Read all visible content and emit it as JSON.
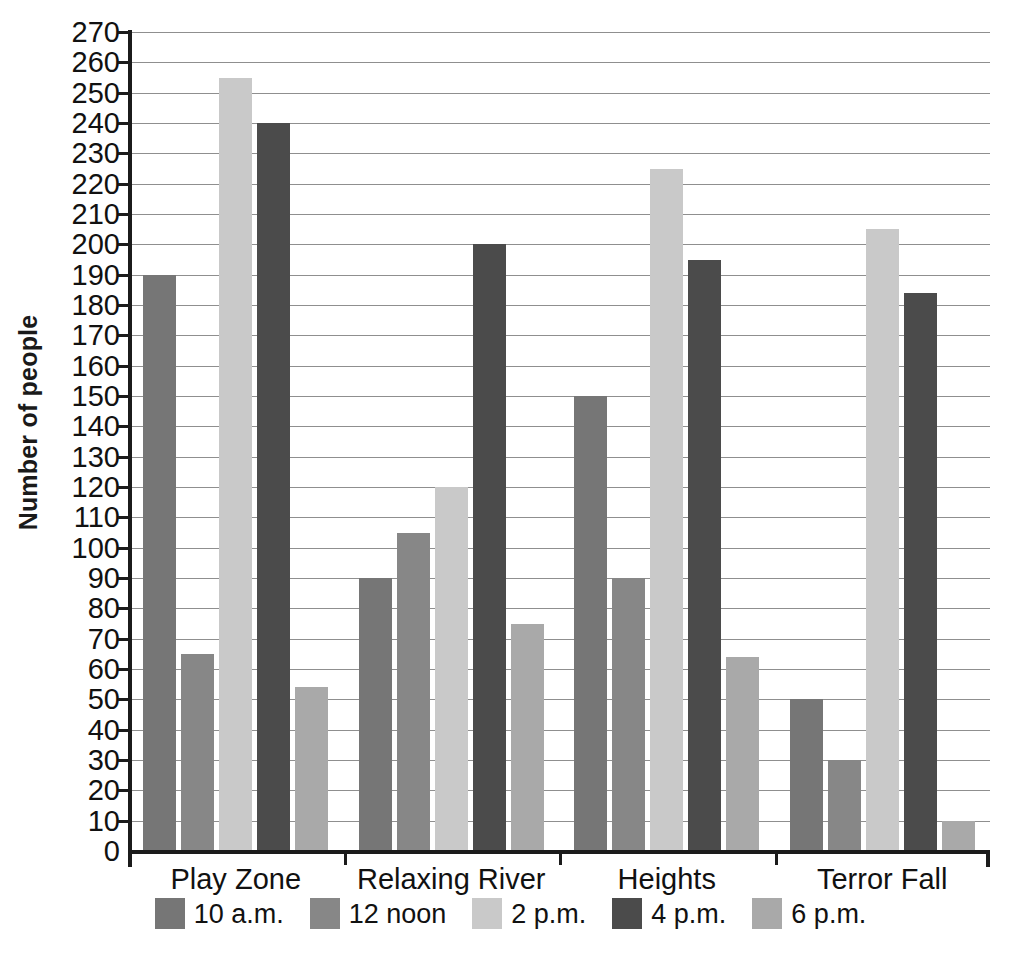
{
  "chart_data": {
    "type": "bar",
    "title": "",
    "xlabel": "",
    "ylabel": "Number of people",
    "ylim": [
      0,
      270
    ],
    "ytick_step": 10,
    "grid": true,
    "legend_position": "bottom",
    "categories": [
      "Play Zone",
      "Relaxing River",
      "Heights",
      "Terror Fall"
    ],
    "y_ticks": [
      "270",
      "260",
      "250",
      "240",
      "230",
      "220",
      "210",
      "200",
      "190",
      "180",
      "170",
      "160",
      "150",
      "140",
      "130",
      "120",
      "110",
      "100",
      "90",
      "80",
      "70",
      "60",
      "50",
      "40",
      "30",
      "20",
      "10",
      "0"
    ],
    "series": [
      {
        "name": "10 a.m.",
        "color": "#767676",
        "values": [
          190,
          90,
          150,
          50
        ]
      },
      {
        "name": "12 noon",
        "color": "#878787",
        "values": [
          65,
          105,
          90,
          30
        ]
      },
      {
        "name": "2 p.m.",
        "color": "#c9c9c9",
        "values": [
          255,
          120,
          225,
          205
        ]
      },
      {
        "name": "4 p.m.",
        "color": "#4b4b4b",
        "values": [
          240,
          200,
          195,
          184
        ]
      },
      {
        "name": "6 p.m.",
        "color": "#a9a9a9",
        "values": [
          54,
          75,
          64,
          10
        ]
      }
    ]
  },
  "axis": {
    "y_title": "Number of people"
  }
}
